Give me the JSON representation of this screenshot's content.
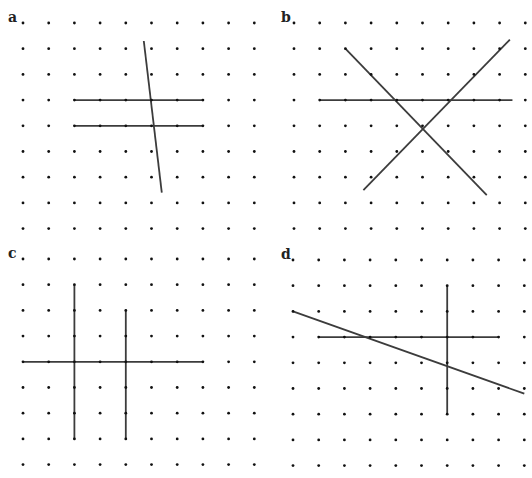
{
  "figure": {
    "width": 532,
    "height": 478,
    "colors": {
      "background": "#ffffff",
      "dot": "#111111",
      "line": "#3c3c3c"
    },
    "grid": {
      "cols": 10,
      "rows": 9,
      "spacing": 25.7,
      "dot_radius": 1.4
    },
    "panels": [
      {
        "label": "a",
        "origin": [
          23,
          23
        ],
        "label_pos": [
          8,
          10
        ],
        "lines": [
          {
            "from": [
              4.7,
              0.7
            ],
            "to": [
              5.4,
              6.6
            ]
          },
          {
            "from": [
              2,
              3
            ],
            "to": [
              7,
              3
            ]
          },
          {
            "from": [
              2,
              4
            ],
            "to": [
              7,
              4
            ]
          }
        ]
      },
      {
        "label": "b",
        "origin": [
          294,
          23
        ],
        "label_pos": [
          281,
          10
        ],
        "lines": [
          {
            "from": [
              2,
              1
            ],
            "to": [
              7.5,
              6.7
            ]
          },
          {
            "from": [
              2.7,
              6.5
            ],
            "to": [
              8.4,
              0.65
            ]
          },
          {
            "from": [
              1,
              3
            ],
            "to": [
              8.5,
              3
            ]
          }
        ]
      },
      {
        "label": "c",
        "origin": [
          23,
          259
        ],
        "label_pos": [
          8,
          246
        ],
        "lines": [
          {
            "from": [
              2,
              1
            ],
            "to": [
              2,
              7
            ]
          },
          {
            "from": [
              4,
              2
            ],
            "to": [
              4,
              7
            ]
          },
          {
            "from": [
              0,
              4
            ],
            "to": [
              7,
              4
            ]
          }
        ]
      },
      {
        "label": "d",
        "origin": [
          293,
          260
        ],
        "label_pos": [
          281,
          247
        ],
        "lines": [
          {
            "from": [
              6,
              1
            ],
            "to": [
              6,
              6
            ]
          },
          {
            "from": [
              1,
              3
            ],
            "to": [
              8,
              3
            ]
          },
          {
            "from": [
              0,
              2
            ],
            "to": [
              9,
              5.2
            ]
          }
        ]
      }
    ]
  }
}
